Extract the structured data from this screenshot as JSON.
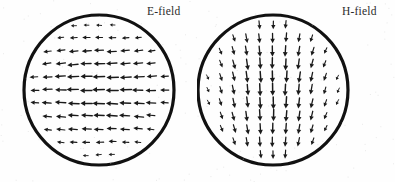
{
  "figure": {
    "name": "waveguide-field-pattern",
    "width": 395,
    "height": 182,
    "background_color": "#fefefe",
    "ink_color": "#151515"
  },
  "panels": [
    {
      "id": "e-field",
      "label": "E-field",
      "label_x": 147,
      "label_y": 5,
      "circle": {
        "cx": 99,
        "cy": 90,
        "r": 75,
        "stroke_width": 3.2,
        "stroke_color": "#111111"
      },
      "arrow_direction": "left",
      "arrow_color": "#1a1a1a"
    },
    {
      "id": "h-field",
      "label": "H-field",
      "label_x": 145,
      "label_y": 5,
      "circle": {
        "cx": 76,
        "cy": 90,
        "r": 75,
        "stroke_width": 3.2,
        "stroke_color": "#111111"
      },
      "arrow_direction": "down",
      "arrow_color": "#1a1a1a"
    }
  ],
  "chart_data": {
    "type": "scatter",
    "title": "",
    "subtitle": "",
    "xlabel": "",
    "ylabel": "",
    "legend_position": "top-right",
    "grid": false,
    "panels": [
      {
        "name": "E-field",
        "geometry": "circle",
        "center": [
          99,
          90
        ],
        "radius": 75,
        "grid_spacing": 13,
        "vector_field": "transverse-electric",
        "dominant_direction_deg": 180,
        "arrow_count_approx": 120,
        "notes": "Arrows point predominantly in the negative x direction; magnitude is largest along the horizontal centerline and tapers toward the top and bottom of the circle; arrows fan slightly upward near the top edge and downward near the bottom edge."
      },
      {
        "name": "H-field",
        "geometry": "circle",
        "center": [
          273,
          90
        ],
        "radius": 75,
        "grid_spacing": 13,
        "vector_field": "transverse-magnetic",
        "dominant_direction_deg": 270,
        "arrow_count_approx": 120,
        "notes": "Arrows point predominantly in the positive y (downward) direction; magnitude is largest along the vertical centerline and tapers toward the left and right of the circle; arrows fan outward to the left near the left edge and to the right near the right edge."
      }
    ]
  }
}
